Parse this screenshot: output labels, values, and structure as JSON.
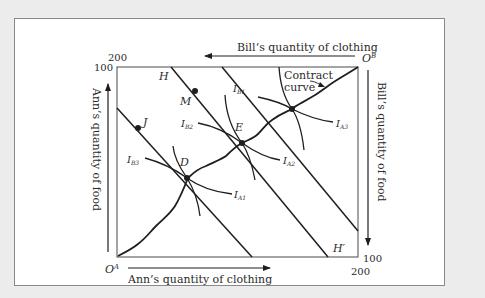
{
  "figure": {
    "top_axis_label": "Bill’s quantity of clothing",
    "bottom_axis_label": "Ann’s quantity of clothing",
    "left_axis_label": "Ann’s quantity of food",
    "right_axis_label": "Bill’s quantity of food",
    "origin_a": "O",
    "origin_a_sup": "A",
    "origin_b": "O",
    "origin_b_sup": "B",
    "tick_top_left_200": "200",
    "tick_top_left_100": "100",
    "tick_bottom_right_100": "100",
    "tick_bottom_right_200": "200",
    "point_h": "H",
    "point_h_prime": "H′",
    "point_m": "M",
    "point_j": "J",
    "point_e": "E",
    "point_d": "D",
    "contract_curve_label_line1": "Contract",
    "contract_curve_label_line2": "curve",
    "ib1": {
      "main": "I",
      "sub": "B1"
    },
    "ib2": {
      "main": "I",
      "sub": "B2"
    },
    "ib3": {
      "main": "I",
      "sub": "B3"
    },
    "ia3_top": {
      "main": "I",
      "sub": "A3"
    },
    "ia2": {
      "main": "I",
      "sub": "A2"
    },
    "ia1": {
      "main": "I",
      "sub": "A1"
    }
  },
  "colors": {
    "background": "#ececec",
    "panel": "#ffffff",
    "ink": "#1e1e1e",
    "text": "#2a2a2a"
  }
}
